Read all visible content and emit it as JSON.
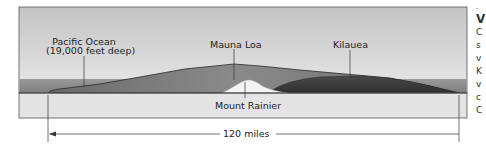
{
  "diagram": {
    "type": "cross-section comparison",
    "labels": {
      "ocean": "Pacific Ocean",
      "ocean_depth": "(19,000 feet deep)",
      "mauna_loa": "Mauna Loa",
      "kilauea": "Kilauea",
      "mount_rainier": "Mount Rainier"
    },
    "scale": {
      "label": "120 miles"
    },
    "colors": {
      "sky_top": "#c4c4c4",
      "sky_bottom": "#e6e6e6",
      "ocean": "#8e8e8e",
      "mauna_loa": "#6e6e6e",
      "kilauea": "#3e3e3e",
      "rainier": "#f4f4f4",
      "ground_box": "#e4e4e4",
      "line": "#333333"
    }
  },
  "side_text": {
    "chars": [
      "-",
      "V",
      "C",
      "s",
      "v",
      "K",
      "v",
      "c",
      "C"
    ]
  }
}
